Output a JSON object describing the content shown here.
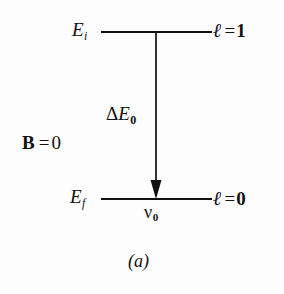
{
  "figure": {
    "caption": "(a)",
    "condition": {
      "symbol": "B",
      "equals": "=",
      "value": "0"
    },
    "levels": [
      {
        "id": "initial",
        "energy_label": "E",
        "energy_sub": "i",
        "quantum_symbol": "ℓ",
        "quantum_equals": "=",
        "quantum_value": "1"
      },
      {
        "id": "final",
        "energy_label": "E",
        "energy_sub": "f",
        "quantum_symbol": "ℓ",
        "quantum_equals": "=",
        "quantum_value": "0"
      }
    ],
    "transition": {
      "gap_label_delta": "Δ",
      "gap_label_var": "E",
      "gap_label_sub": "0",
      "frequency_symbol": "ν",
      "frequency_sub": "0",
      "direction": "downward",
      "arrow_name": "transition-arrow"
    },
    "colors": {
      "ink": "#111111",
      "background": "#fdfdfd"
    }
  }
}
